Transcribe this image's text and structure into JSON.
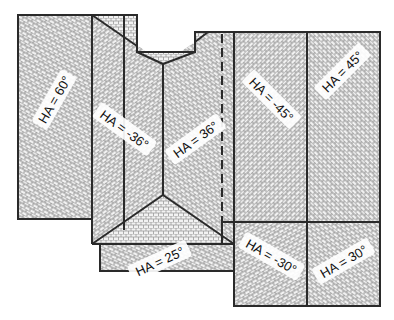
{
  "diagram": {
    "type": "roof plan",
    "colors": {
      "outline": "#2a2a2a",
      "hatch": "#9a9a9a",
      "background": "#ffffff"
    },
    "planes": [
      {
        "id": "west-wing",
        "label": "HA = 60°",
        "angle": 60
      },
      {
        "id": "center-left",
        "label": "HA = -36°",
        "angle": -36
      },
      {
        "id": "center-right",
        "label": "HA = 36°",
        "angle": 36
      },
      {
        "id": "front-gable",
        "label": "HA = 25°",
        "angle": 25
      },
      {
        "id": "east-upper-left",
        "label": "HA = -45°",
        "angle": -45
      },
      {
        "id": "east-upper-right",
        "label": "HA = 45°",
        "angle": 45
      },
      {
        "id": "east-lower-left",
        "label": "HA = -30°",
        "angle": -30
      },
      {
        "id": "east-lower-right",
        "label": "HA = 30°",
        "angle": 30
      }
    ]
  }
}
